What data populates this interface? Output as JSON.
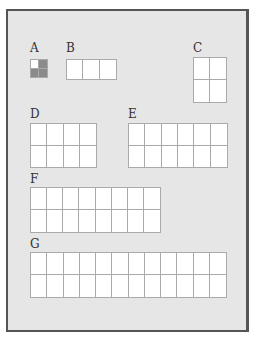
{
  "blocks": [
    {
      "id": "A",
      "label": "A",
      "cols": 2,
      "rows": 2,
      "x": 30,
      "y": 59,
      "w": 18,
      "h": 19,
      "label_x": 30,
      "label_y": 42,
      "filled": [
        1,
        2,
        3
      ]
    },
    {
      "id": "B",
      "label": "B",
      "cols": 3,
      "rows": 1,
      "x": 66,
      "y": 59,
      "w": 51,
      "h": 21,
      "label_x": 66,
      "label_y": 42,
      "filled": []
    },
    {
      "id": "C",
      "label": "C",
      "cols": 2,
      "rows": 2,
      "x": 193,
      "y": 57,
      "w": 34,
      "h": 46,
      "label_x": 193,
      "label_y": 42,
      "filled": []
    },
    {
      "id": "D",
      "label": "D",
      "cols": 4,
      "rows": 2,
      "x": 30,
      "y": 123,
      "w": 67,
      "h": 45,
      "label_x": 30,
      "label_y": 108,
      "filled": []
    },
    {
      "id": "E",
      "label": "E",
      "cols": 6,
      "rows": 2,
      "x": 128,
      "y": 123,
      "w": 100,
      "h": 45,
      "label_x": 128,
      "label_y": 108,
      "filled": []
    },
    {
      "id": "F",
      "label": "F",
      "cols": 8,
      "rows": 2,
      "x": 30,
      "y": 187,
      "w": 131,
      "h": 46,
      "label_x": 30,
      "label_y": 173,
      "filled": []
    },
    {
      "id": "G",
      "label": "G",
      "cols": 12,
      "rows": 2,
      "x": 30,
      "y": 252,
      "w": 197,
      "h": 46,
      "label_x": 30,
      "label_y": 238,
      "filled": []
    }
  ]
}
